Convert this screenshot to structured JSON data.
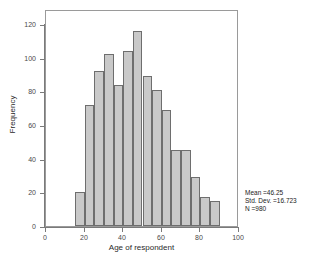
{
  "chart_data": {
    "type": "bar",
    "title": "",
    "xlabel": "Age of respondent",
    "ylabel": "Frequency",
    "xlim": [
      0,
      100
    ],
    "ylim": [
      0,
      126
    ],
    "xticks": [
      0,
      20,
      40,
      60,
      80,
      100
    ],
    "yticks": [
      0,
      20,
      40,
      60,
      80,
      100,
      120
    ],
    "grid": false,
    "legend": null,
    "bin_width": 5,
    "bin_starts": [
      15,
      20,
      25,
      30,
      35,
      40,
      45,
      50,
      55,
      60,
      65,
      70,
      75,
      80,
      85
    ],
    "categories": [
      "15-20",
      "20-25",
      "25-30",
      "30-35",
      "35-40",
      "40-45",
      "45-50",
      "50-55",
      "55-60",
      "60-65",
      "65-70",
      "70-75",
      "75-80",
      "80-85",
      "85-90"
    ],
    "values": [
      20,
      72,
      92,
      102,
      84,
      104,
      116,
      89,
      81,
      69,
      45,
      45,
      29,
      17,
      15
    ],
    "bar_fill_color": "#c9c9c9",
    "bar_edge_color": "#6e6e6e",
    "annotations": [
      "Mean =46.25",
      "Std. Dev. =16.723",
      "N =980"
    ]
  },
  "stats": {
    "mean_label": "Mean =46.25",
    "std_dev_label": "Std. Dev. =16.723",
    "n_label": "N =980"
  }
}
